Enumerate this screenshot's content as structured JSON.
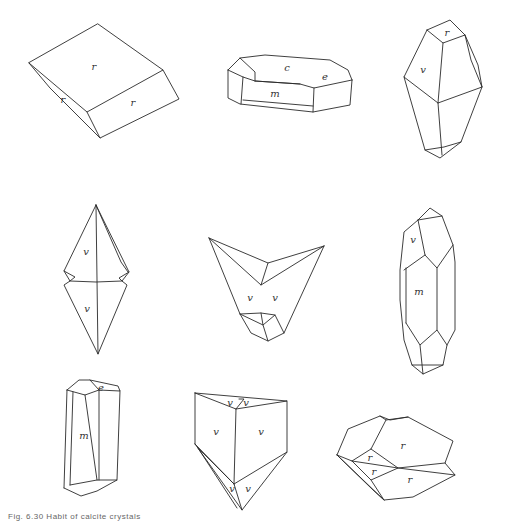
{
  "figure": {
    "caption": "Fig. 6.30  Habit of calcite crystals",
    "crystals": [
      {
        "id": 1,
        "labels": [
          "r",
          "r",
          "r"
        ]
      },
      {
        "id": 2,
        "labels": [
          "c",
          "e",
          "m"
        ]
      },
      {
        "id": 3,
        "labels": [
          "r",
          "v"
        ]
      },
      {
        "id": 4,
        "labels": [
          "v",
          "v"
        ]
      },
      {
        "id": 5,
        "labels": [
          "v",
          "v"
        ]
      },
      {
        "id": 6,
        "labels": [
          "v",
          "m"
        ]
      },
      {
        "id": 7,
        "labels": [
          "e",
          "m"
        ]
      },
      {
        "id": 8,
        "labels": [
          "v",
          "v",
          "v",
          "v",
          "v",
          "v"
        ]
      },
      {
        "id": 9,
        "labels": [
          "r",
          "r",
          "r",
          "r"
        ]
      }
    ]
  }
}
